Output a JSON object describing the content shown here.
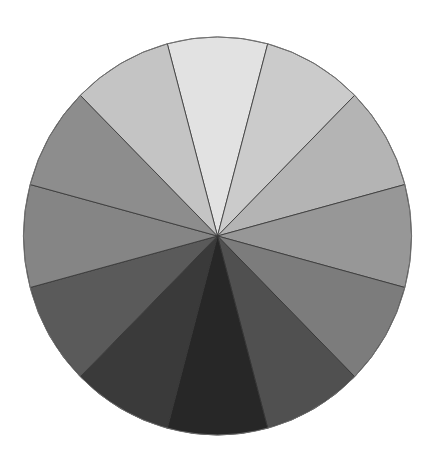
{
  "chart_data": {
    "type": "pie",
    "title": "",
    "center": [
      217.5,
      236
    ],
    "radius_x": 194,
    "radius_y": 199,
    "start_angle_deg": -15,
    "direction": "clockwise",
    "stroke_color": "#333333",
    "labels": [
      "Slice 1",
      "Slice 2",
      "Slice 3",
      "Slice 4",
      "Slice 5",
      "Slice 6",
      "Slice 7",
      "Slice 8",
      "Slice 9",
      "Slice 10",
      "Slice 11",
      "Slice 12"
    ],
    "values": [
      1,
      1,
      1,
      1,
      1,
      1,
      1,
      1,
      1,
      1,
      1,
      1
    ],
    "colors": [
      "#e2e2e2",
      "#cbcbcb",
      "#b4b4b4",
      "#979797",
      "#7c7c7c",
      "#505050",
      "#272727",
      "#3a3a3a",
      "#5a5a5a",
      "#858585",
      "#8d8d8d",
      "#c4c4c4"
    ],
    "legend": "none"
  }
}
